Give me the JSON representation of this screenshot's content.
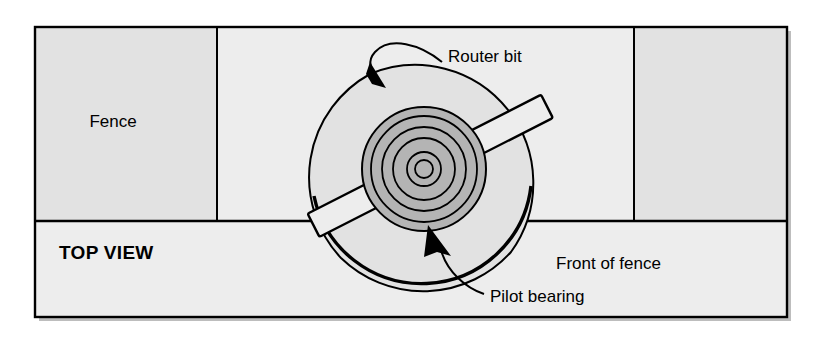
{
  "figure": {
    "view_label": "TOP VIEW",
    "frame": {
      "x": 35,
      "y": 27,
      "width": 752,
      "height": 290,
      "border_color": "#000000",
      "background_color": "#ededed"
    }
  },
  "labels": {
    "fence": "Fence",
    "top_view": "TOP VIEW",
    "router_bit": "Router bit",
    "pilot_bearing": "Pilot bearing",
    "front_of_fence": "Front of fence"
  },
  "regions": {
    "fence_left": {
      "name": "Fence",
      "x": 35,
      "y": 27,
      "width": 182,
      "height": 194,
      "fill": "#e2e2e2"
    },
    "fence_gap": {
      "name": "Fence opening",
      "x": 217,
      "y": 27,
      "width": 417,
      "height": 194,
      "fill": "#ededed"
    },
    "fence_right": {
      "name": "Fence",
      "x": 634,
      "y": 27,
      "width": 153,
      "height": 194,
      "fill": "#e2e2e2"
    },
    "front_area": {
      "name": "Front of fence",
      "x": 35,
      "y": 221,
      "width": 752,
      "height": 96,
      "fill": "#ededed"
    }
  },
  "bit": {
    "center_x": 424,
    "center_y": 169,
    "cutter_sweep_radius": 110,
    "bearing_rings_radii": [
      62,
      53,
      42,
      31,
      17,
      9
    ],
    "bearing_fill": "#b4b4b4",
    "cutter_fill": "#e2e2e2",
    "wing_fill": "#ededed",
    "wing_angle_degrees": -27,
    "line_color": "#000000"
  },
  "colors": {
    "page_background": "#ffffff",
    "panel_background": "#ededed",
    "fence_block": "#e2e2e2",
    "bearing_gray": "#b4b4b4",
    "outline": "#000000"
  },
  "annotations": [
    {
      "id": "router-bit",
      "text": "Router bit",
      "text_x": 448,
      "text_y": 58,
      "arrow_tip_x": 381,
      "arrow_tip_y": 83
    },
    {
      "id": "pilot-bearing",
      "text": "Pilot bearing",
      "text_x": 490,
      "text_y": 298,
      "arrow_tip_x": 434,
      "arrow_tip_y": 232
    }
  ]
}
